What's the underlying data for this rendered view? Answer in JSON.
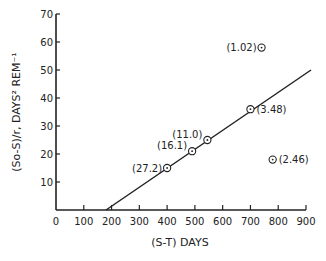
{
  "chart_data": {
    "type": "scatter",
    "title": "",
    "xlabel": "(S-T) DAYS",
    "ylabel": "(So-S)/r, DAYS² REM⁻¹",
    "xlim": [
      0,
      900
    ],
    "ylim": [
      0,
      70
    ],
    "xticks": [
      0,
      100,
      200,
      300,
      400,
      500,
      600,
      700,
      800,
      900
    ],
    "yticks": [
      10,
      20,
      30,
      40,
      50,
      60,
      70
    ],
    "grid": false,
    "legend": null,
    "points": [
      {
        "x": 400,
        "y": 15,
        "label": "(27.2)"
      },
      {
        "x": 490,
        "y": 21,
        "label": "(16.1)"
      },
      {
        "x": 545,
        "y": 25,
        "label": "(11.0)"
      },
      {
        "x": 700,
        "y": 36,
        "label": "(3.48)"
      },
      {
        "x": 740,
        "y": 58,
        "label": "(1.02)"
      },
      {
        "x": 780,
        "y": 18,
        "label": "(2.46)"
      }
    ],
    "fit_line": {
      "x0": 180,
      "y0": 0,
      "x1": 918,
      "y1": 50
    }
  }
}
